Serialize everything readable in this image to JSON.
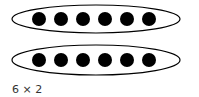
{
  "diagram": {
    "groups": [
      {
        "dots": 6,
        "cy": 19
      },
      {
        "dots": 6,
        "cy": 60
      }
    ],
    "caption": "6 × 2",
    "colors": {
      "dot": "#000000",
      "outline": "#000000",
      "text": "#333333"
    }
  }
}
